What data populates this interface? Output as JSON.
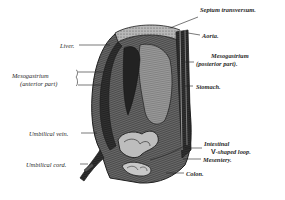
{
  "figure": {
    "labels": {
      "septum_transversum": "Septum transversum.",
      "aorta": "Aorta.",
      "liver": "Liver.",
      "mesogastrium_posterior_line1": "Mesogastrium",
      "mesogastrium_posterior_line2": "(posterior part).",
      "mesogastrium_anterior_line1": "Mesogastrium",
      "mesogastrium_anterior_line2": "(anterior part)",
      "stomach": "Stomach.",
      "umbilical_vein": "Umbilical vein.",
      "intestinal_line1": "Intestinal",
      "intestinal_v": "V",
      "intestinal_line2": "-shaped loop.",
      "mesentery": "Mesentery.",
      "umbilical_cord": "Umbilical cord.",
      "colon": "Colon."
    },
    "colors": {
      "ink": "#1e1e1e",
      "shade_dark": "#2c2c2c",
      "shade_mid": "#6a6a6a",
      "shade_light": "#a8a8a8",
      "paper": "#ffffff"
    }
  }
}
